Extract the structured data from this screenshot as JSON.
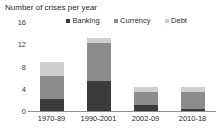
{
  "chart_data": {
    "type": "bar",
    "subtype": "stacked-bar",
    "title": "Number of crises per year",
    "xlabel": "",
    "ylabel": "",
    "categories": [
      "1970-89",
      "1990-2001",
      "2002-09",
      "2010-18"
    ],
    "series": [
      {
        "name": "Banking",
        "values": [
          2.2,
          5.4,
          1.1,
          0.3
        ],
        "color": "#3b3b3b"
      },
      {
        "name": "Currency",
        "values": [
          4.1,
          6.9,
          2.4,
          3.1
        ],
        "color": "#8c8c8c"
      },
      {
        "name": "Debt",
        "values": [
          2.5,
          0.9,
          0.8,
          0.9
        ],
        "color": "#cfcfcf"
      }
    ],
    "totals": [
      8.8,
      13.2,
      4.3,
      4.3
    ],
    "ylim": [
      0,
      16
    ],
    "yticks": [
      16,
      12,
      8,
      4,
      0
    ],
    "ytick_labels": [
      "16",
      "12",
      "8",
      "4",
      "0"
    ],
    "grid": false,
    "legend_position": "top"
  },
  "colors": {
    "banking": "#3b3b3b",
    "currency": "#8c8c8c",
    "debt": "#cfcfcf",
    "axis": "#8f8f8f",
    "text": "#2b2b2b",
    "background": "#ffffff"
  }
}
